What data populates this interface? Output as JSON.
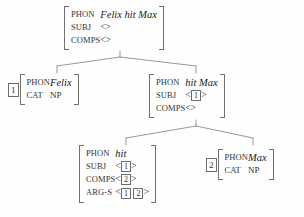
{
  "diagram": {
    "type": "hpsg-syntactic-tree",
    "title": "Felix hit Max",
    "ink_color": "#3a3a3a",
    "line_color": "#8c8c8c",
    "background": "#fefefe",
    "angle_open": "<",
    "angle_close": ">",
    "empty_list": "<>"
  },
  "nodes": {
    "root": {
      "id": "root",
      "tag": "",
      "features": [
        {
          "attr": "PHON",
          "value": "Felix hit Max",
          "style": "italic"
        },
        {
          "attr": "SUBJ",
          "value": "<>",
          "style": "list"
        },
        {
          "attr": "COMPS",
          "value": "<>",
          "style": "list"
        }
      ]
    },
    "subject": {
      "id": "subject",
      "tag": "1",
      "features": [
        {
          "attr": "PHON",
          "value": "Felix",
          "style": "italic"
        },
        {
          "attr": "CAT",
          "value": "NP",
          "style": "cat"
        }
      ]
    },
    "vp": {
      "id": "vp",
      "tag": "",
      "features": [
        {
          "attr": "PHON",
          "value": "hit Max",
          "style": "italic"
        },
        {
          "attr": "SUBJ",
          "value": "< 1 >",
          "tags": [
            "1"
          ],
          "style": "taglist"
        },
        {
          "attr": "COMPS",
          "value": "<>",
          "style": "list"
        }
      ]
    },
    "verb": {
      "id": "verb",
      "tag": "",
      "features": [
        {
          "attr": "PHON",
          "value": "hit",
          "style": "italic"
        },
        {
          "attr": "SUBJ",
          "value": "< 1 >",
          "tags": [
            "1"
          ],
          "style": "taglist"
        },
        {
          "attr": "COMPS",
          "value": "< 2 >",
          "tags": [
            "2"
          ],
          "style": "taglist"
        },
        {
          "attr": "ARG-S",
          "value": "< 1 2 >",
          "tags": [
            "1",
            "2"
          ],
          "style": "taglist"
        }
      ]
    },
    "object": {
      "id": "object",
      "tag": "2",
      "features": [
        {
          "attr": "PHON",
          "value": "Max",
          "style": "italic"
        },
        {
          "attr": "CAT",
          "value": "NP",
          "style": "cat"
        }
      ]
    }
  },
  "edges": [
    {
      "from": "root",
      "to": "subject"
    },
    {
      "from": "root",
      "to": "vp"
    },
    {
      "from": "vp",
      "to": "verb"
    },
    {
      "from": "vp",
      "to": "object"
    }
  ]
}
